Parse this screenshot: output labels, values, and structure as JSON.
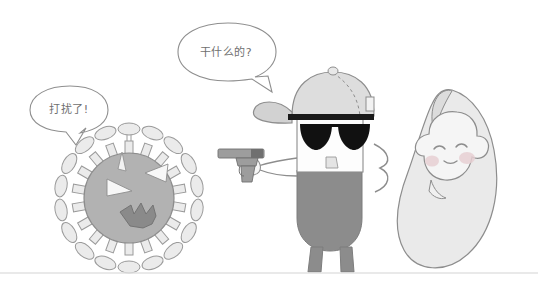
{
  "scene": {
    "title": "Comic strip: masked character with pistol confronts virus while swaddled baby sleeps",
    "width": 538,
    "height": 288,
    "background_color": "#ffffff",
    "bottom_rule_color": "#e2e2e2"
  },
  "palette": {
    "outline": "#7a7a7a",
    "outline_soft": "#9a9a9a",
    "body_gray": "#8c8c8c",
    "virus_body": "#b0b0b0",
    "virus_spike": "#e8e8e8",
    "virus_face": "#f6f6f6",
    "cap_gray": "#d8d8d8",
    "cap_light": "#ececec",
    "lens_black": "#111111",
    "cocoon_fill": "#e9e9e9",
    "baby_face": "#f4f4f4",
    "blush_pink": "#e9cdd0",
    "gun_gray": "#9d9d9d",
    "gun_dark": "#6d6d6d",
    "bubble_fill": "#ffffff",
    "text_gray": "#6f6f6f"
  },
  "speech_bubbles": [
    {
      "id": "virus-bubble",
      "speaker": "virus",
      "text": "打扰了!",
      "position": "left",
      "tail_direction": "down-right"
    },
    {
      "id": "gunman-bubble",
      "speaker": "gunman",
      "text": "干什么的?",
      "position": "top-center",
      "tail_direction": "down-left"
    }
  ],
  "characters": [
    {
      "id": "virus",
      "name": "angry-virus",
      "expression": "angry",
      "spike_count": 18,
      "features": [
        "slanted-eyes",
        "jagged-mouth",
        "mushroom-spikes"
      ]
    },
    {
      "id": "gunman",
      "name": "capped-gunman",
      "expression": "stern",
      "features": [
        "baseball-cap",
        "sunglasses",
        "pistol",
        "two-legs"
      ],
      "holds": "pistol"
    },
    {
      "id": "baby",
      "name": "swaddled-baby",
      "expression": "sleeping",
      "features": [
        "closed-eyes",
        "blush-cheeks",
        "smile",
        "cocoon-wrap"
      ]
    }
  ]
}
